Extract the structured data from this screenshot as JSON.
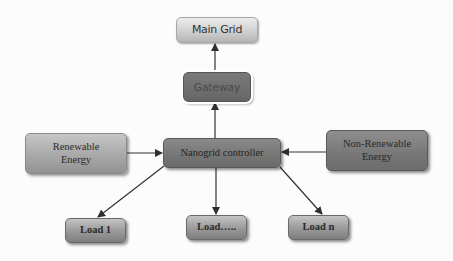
{
  "diagram": {
    "type": "block-flow",
    "nodes": {
      "main_grid": {
        "label": "Main Grid"
      },
      "gateway": {
        "label": "Gateway"
      },
      "controller": {
        "label": "Nanogrid controller"
      },
      "renewable": {
        "line1": "Renewable",
        "line2": "Energy"
      },
      "nonrenewable": {
        "line1": "Non-Renewable",
        "line2": "Energy"
      },
      "load_1": {
        "label": "Load 1"
      },
      "load_mid": {
        "label": "Load….."
      },
      "load_n": {
        "label": "Load n"
      }
    },
    "edges": [
      {
        "from": "gateway",
        "to": "main_grid"
      },
      {
        "from": "controller",
        "to": "gateway"
      },
      {
        "from": "renewable",
        "to": "controller"
      },
      {
        "from": "nonrenewable",
        "to": "controller"
      },
      {
        "from": "controller",
        "to": "load_1"
      },
      {
        "from": "controller",
        "to": "load_mid"
      },
      {
        "from": "controller",
        "to": "load_n"
      }
    ],
    "colors": {
      "edge": "#333333",
      "main_grid_fill": "#d0d0d0",
      "gateway_fill": "#6c6c6c",
      "controller_fill": "#777777",
      "renewable_fill": "#a8a8a8",
      "nonrenewable_fill": "#777777",
      "load_fill": "#9c9c9c"
    }
  }
}
